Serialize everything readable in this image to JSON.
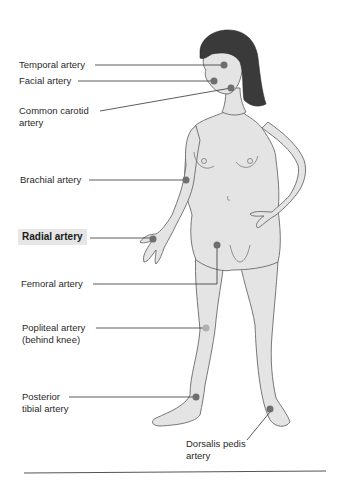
{
  "figure": {
    "highlighted_label": "Radial artery",
    "colors": {
      "skin": "#e4e4e4",
      "outline": "#6a6a6a",
      "hair": "#3a3a3a",
      "pulse_dot": "#6e6e6e",
      "pulse_dot_light": "#b0b0b0",
      "leader_line": "#333333",
      "highlight_bg": "#e6e6e6"
    }
  },
  "labels": [
    {
      "id": "temporal",
      "text": "Temporal artery",
      "x": 19,
      "y": 60
    },
    {
      "id": "facial",
      "text": "Facial artery",
      "x": 19,
      "y": 76
    },
    {
      "id": "carotid",
      "text": "Common carotid\nartery",
      "x": 19,
      "y": 106
    },
    {
      "id": "brachial",
      "text": "Brachial artery",
      "x": 20,
      "y": 175
    },
    {
      "id": "radial",
      "text": "Radial artery",
      "x": 21,
      "y": 232,
      "highlight": true
    },
    {
      "id": "femoral",
      "text": "Femoral artery",
      "x": 21,
      "y": 278
    },
    {
      "id": "popliteal",
      "text": "Popliteal artery\n(behind knee)",
      "x": 22,
      "y": 323
    },
    {
      "id": "posterior_tibial",
      "text": "Posterior\ntibial artery",
      "x": 22,
      "y": 392
    },
    {
      "id": "dorsalis_pedis",
      "text": "Dorsalis pedis\nartery",
      "x": 186,
      "y": 439
    }
  ],
  "pulse_points": [
    {
      "id": "temporal",
      "x": 224,
      "y": 65
    },
    {
      "id": "facial",
      "x": 214,
      "y": 81
    },
    {
      "id": "carotid",
      "x": 231,
      "y": 88
    },
    {
      "id": "brachial",
      "x": 186,
      "y": 180
    },
    {
      "id": "radial",
      "x": 153,
      "y": 239
    },
    {
      "id": "femoral",
      "x": 217,
      "y": 245
    },
    {
      "id": "popliteal",
      "x": 206,
      "y": 328,
      "light": true
    },
    {
      "id": "posterior_tibial",
      "x": 196,
      "y": 397
    },
    {
      "id": "dorsalis_pedis",
      "x": 270,
      "y": 409
    }
  ]
}
